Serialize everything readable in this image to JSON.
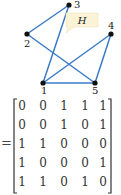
{
  "graph": {
    "name": "H",
    "edge_color": "#3a7bc8",
    "label_bg": "#fbf3d5",
    "nodes": [
      {
        "id": "1",
        "x": 43,
        "y": 83
      },
      {
        "id": "2",
        "x": 27,
        "y": 34
      },
      {
        "id": "3",
        "x": 69,
        "y": 5
      },
      {
        "id": "4",
        "x": 111,
        "y": 34
      },
      {
        "id": "5",
        "x": 95,
        "y": 83
      }
    ],
    "edges": [
      [
        "1",
        "3"
      ],
      [
        "1",
        "4"
      ],
      [
        "1",
        "5"
      ],
      [
        "2",
        "3"
      ],
      [
        "2",
        "5"
      ],
      [
        "4",
        "5"
      ]
    ]
  },
  "matrix": {
    "prefix": "=",
    "rows": [
      [
        "0",
        "0",
        "1",
        "1",
        "1"
      ],
      [
        "0",
        "0",
        "1",
        "0",
        "1"
      ],
      [
        "1",
        "1",
        "0",
        "0",
        "0"
      ],
      [
        "1",
        "0",
        "0",
        "0",
        "1"
      ],
      [
        "1",
        "1",
        "0",
        "1",
        "0"
      ]
    ]
  }
}
